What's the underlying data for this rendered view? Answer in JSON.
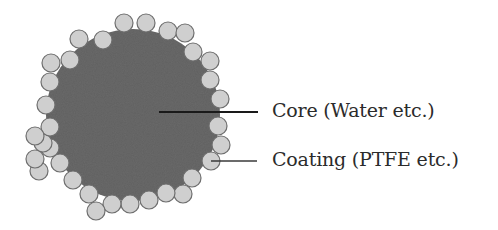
{
  "diagram": {
    "labels": {
      "core": "Core (Water etc.)",
      "coating": "Coating (PTFE etc.)"
    },
    "colors": {
      "core_fill": "#6b6b6b",
      "particle_fill": "#cfcfcf",
      "particle_stroke": "#6e6e6e",
      "leader_line": "#1a1a1a",
      "text": "#2b2b2b"
    },
    "core": {
      "cx": 133,
      "cy": 115,
      "rx": 87,
      "ry": 86
    },
    "particle_radius": 9,
    "particles": [
      [
        103,
        40
      ],
      [
        124,
        23
      ],
      [
        146,
        23
      ],
      [
        168,
        31
      ],
      [
        185,
        33
      ],
      [
        193,
        52
      ],
      [
        210,
        61
      ],
      [
        210,
        80
      ],
      [
        220,
        99
      ],
      [
        218,
        126
      ],
      [
        221,
        145
      ],
      [
        211,
        161
      ],
      [
        192,
        178
      ],
      [
        183,
        194
      ],
      [
        166,
        193
      ],
      [
        149,
        200
      ],
      [
        130,
        204
      ],
      [
        112,
        204
      ],
      [
        96,
        211
      ],
      [
        89,
        194
      ],
      [
        73,
        180
      ],
      [
        60,
        163
      ],
      [
        50,
        148
      ],
      [
        39,
        171
      ],
      [
        35,
        159
      ],
      [
        43,
        143
      ],
      [
        50,
        127
      ],
      [
        35,
        136
      ],
      [
        46,
        105
      ],
      [
        50,
        82
      ],
      [
        51,
        63
      ],
      [
        70,
        60
      ],
      [
        79,
        39
      ]
    ],
    "leaders": {
      "core": {
        "x1": 159,
        "y1": 112,
        "x2": 258,
        "y2": 112
      },
      "coating": {
        "x1": 211,
        "y1": 161,
        "x2": 257,
        "y2": 161
      }
    }
  }
}
